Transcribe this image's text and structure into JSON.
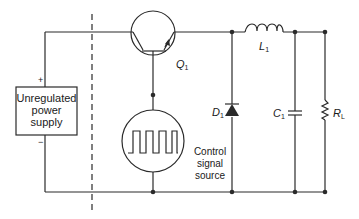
{
  "diagram": {
    "type": "buck converter schematic",
    "stroke_color": "#2a2a2a",
    "supply": {
      "label_lines": [
        "Unregulated",
        "power",
        "supply"
      ],
      "plus": "+",
      "minus": "−"
    },
    "components": {
      "transistor": {
        "name": "Q",
        "sub": "1"
      },
      "inductor": {
        "name": "L",
        "sub": "1"
      },
      "diode": {
        "name": "D",
        "sub": "1"
      },
      "capacitor": {
        "name": "C",
        "sub": "1"
      },
      "resistor": {
        "name": "R",
        "sub": "L"
      }
    },
    "control": {
      "label_lines": [
        "Control",
        "signal",
        "source"
      ],
      "icon": "square-wave-icon"
    }
  }
}
